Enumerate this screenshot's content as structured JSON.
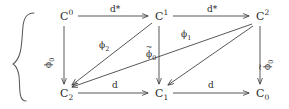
{
  "figure": {
    "type": "commutative-diagram",
    "stroke_color": "#3a3a3a",
    "text_color": "#2a2a2a",
    "background_color": "#ffffff",
    "brace": {
      "name": "left-curly-brace",
      "glyph": "{"
    },
    "nodes": [
      {
        "id": "C0up",
        "base": "C",
        "sup": "0",
        "sub": "",
        "x": 62,
        "y": 18,
        "row": "top"
      },
      {
        "id": "C1up",
        "base": "C",
        "sup": "1",
        "sub": "",
        "x": 157,
        "y": 18,
        "row": "top"
      },
      {
        "id": "C2up",
        "base": "C",
        "sup": "2",
        "sub": "",
        "x": 258,
        "y": 18,
        "row": "top"
      },
      {
        "id": "C2lo",
        "base": "C",
        "sup": "",
        "sub": "2",
        "x": 62,
        "y": 92,
        "row": "bottom"
      },
      {
        "id": "C1lo",
        "base": "C",
        "sup": "",
        "sub": "1",
        "x": 157,
        "y": 92,
        "row": "bottom"
      },
      {
        "id": "C0lo",
        "base": "C",
        "sup": "",
        "sub": "0",
        "x": 258,
        "y": 92,
        "row": "bottom"
      }
    ],
    "edges": [
      {
        "id": "e-top-1",
        "from": "C0up",
        "to": "C1up",
        "label": "d*",
        "label_x": 110,
        "label_y": 6,
        "rotated": false
      },
      {
        "id": "e-top-2",
        "from": "C1up",
        "to": "C2up",
        "label": "d*",
        "label_x": 207,
        "label_y": 6,
        "rotated": false
      },
      {
        "id": "e-bot-1",
        "from": "C2lo",
        "to": "C1lo",
        "label": "d",
        "label_x": 112,
        "label_y": 82,
        "rotated": false
      },
      {
        "id": "e-bot-2",
        "from": "C1lo",
        "to": "C0lo",
        "label": "d",
        "label_x": 208,
        "label_y": 82,
        "rotated": false
      },
      {
        "id": "e-left-vert",
        "from": "C0up",
        "to": "C2lo",
        "label": "phi_0",
        "label_base": "ϕ",
        "label_sub": "0",
        "tilde": false,
        "label_x": 43,
        "label_y": 60,
        "rotated": true
      },
      {
        "id": "e-mid-vert",
        "from": "C1up",
        "to": "C1lo",
        "label": "phi_0_tilde",
        "label_base": "ϕ",
        "label_sub": "0",
        "tilde": true,
        "label_x": 147,
        "label_y": 54,
        "rotated": false
      },
      {
        "id": "e-right-vert",
        "from": "C2up",
        "to": "C0lo",
        "label": "phi_0_tilde",
        "label_base": "ϕ",
        "label_sub": "0",
        "tilde": true,
        "label_x": 262,
        "label_y": 62,
        "rotated": true
      },
      {
        "id": "e-diag-1",
        "from": "C1up",
        "to": "C2lo",
        "label": "phi_1",
        "label_base": "ϕ",
        "label_sub": "1",
        "tilde": false,
        "label_x": 100,
        "label_y": 42,
        "rotated": false
      },
      {
        "id": "e-diag-2",
        "from": "C2up",
        "to": "C2lo",
        "label": "phi_2",
        "label_base": "ϕ",
        "label_sub": "2",
        "tilde": false,
        "label_x": 181,
        "label_y": 31,
        "rotated": false
      },
      {
        "id": "e-diag-3",
        "from": "C2up",
        "to": "C1lo",
        "label": "phi_1",
        "label_base": "ϕ",
        "label_sub": "1",
        "tilde": false,
        "label_x": 212,
        "label_y": 56,
        "rotated": false
      }
    ]
  }
}
